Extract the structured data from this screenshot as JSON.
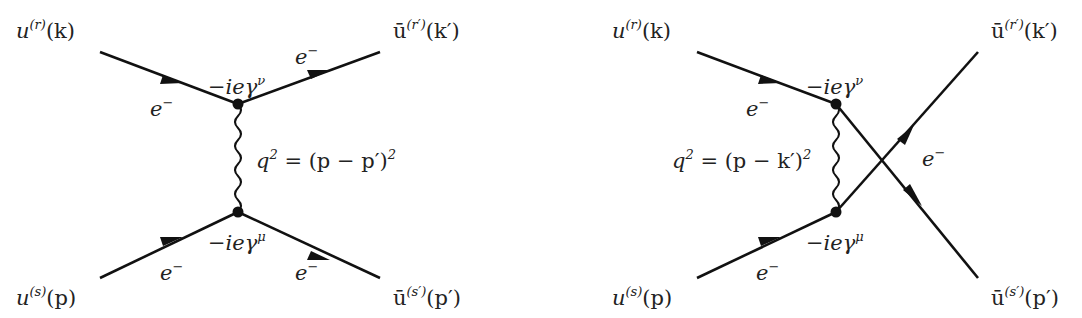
{
  "diagrams": [
    {
      "name": "t-channel",
      "labels": {
        "in_top": {
          "base": "u",
          "sup": "(r)",
          "arg": "(k)"
        },
        "out_top": {
          "base": "ū",
          "sup": "(r′)",
          "arg": "(k′)"
        },
        "in_bottom": {
          "base": "u",
          "sup": "(s)",
          "arg": "(p)"
        },
        "out_bottom": {
          "base": "ū",
          "sup": "(s′)",
          "arg": "(p′)"
        },
        "vertex_top": {
          "base": "−ieγ",
          "sup": "ν"
        },
        "vertex_bottom": {
          "base": "−ieγ",
          "sup": "μ"
        },
        "propagator": {
          "text": "q",
          "sup": "2",
          "rest": " = (p − p′)",
          "sup2": "2"
        },
        "e_in_top": {
          "base": "e",
          "sup": "−"
        },
        "e_out_top": {
          "base": "e",
          "sup": "−"
        },
        "e_in_bottom": {
          "base": "e",
          "sup": "−"
        },
        "e_out_bottom": {
          "base": "e",
          "sup": "−"
        }
      }
    },
    {
      "name": "u-channel",
      "labels": {
        "in_top": {
          "base": "u",
          "sup": "(r)",
          "arg": "(k)"
        },
        "out_top": {
          "base": "ū",
          "sup": "(r′)",
          "arg": "(k′)"
        },
        "in_bottom": {
          "base": "u",
          "sup": "(s)",
          "arg": "(p)"
        },
        "out_bottom": {
          "base": "ū",
          "sup": "(s′)",
          "arg": "(p′)"
        },
        "vertex_top": {
          "base": "−ieγ",
          "sup": "ν"
        },
        "vertex_bottom": {
          "base": "−ieγ",
          "sup": "μ"
        },
        "propagator": {
          "text": "q",
          "sup": "2",
          "rest": " = (p − k′)",
          "sup2": "2"
        },
        "e_in_top": {
          "base": "e",
          "sup": "−"
        },
        "e_in_bottom": {
          "base": "e",
          "sup": "−"
        },
        "e_cross": {
          "base": "e",
          "sup": "−"
        }
      }
    }
  ],
  "colors": {
    "line": "#111111",
    "text": "#222222",
    "background": "#ffffff"
  }
}
